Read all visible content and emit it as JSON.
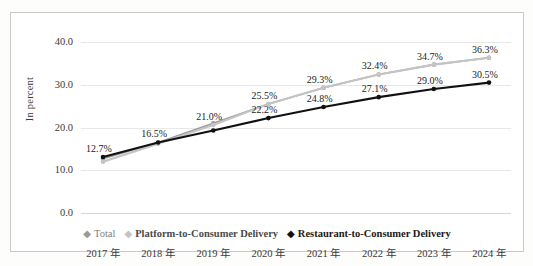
{
  "chart_data": {
    "type": "line",
    "title": "",
    "xlabel": "",
    "ylabel": "In percent",
    "categories": [
      "2017 年",
      "2018 年",
      "2019 年",
      "2020 年",
      "2021 年",
      "2022 年",
      "2023 年",
      "2024 年"
    ],
    "ylim": [
      0.0,
      40.0
    ],
    "yticks": [
      "0.0",
      "10.0",
      "20.0",
      "30.0",
      "40.0"
    ],
    "ytick_values": [
      0.0,
      10.0,
      20.0,
      30.0,
      40.0
    ],
    "grid": true,
    "legend_position": "bottom",
    "series": [
      {
        "name": "Total",
        "color": "#9a9a9a",
        "values": [
          12.7,
          16.5,
          21.0,
          25.5,
          29.3,
          32.4,
          34.7,
          36.3
        ],
        "labels": [
          "12.7%",
          "16.5%",
          "21.0%",
          "25.5%",
          "29.3%",
          "32.4%",
          "34.7%",
          "36.3%"
        ]
      },
      {
        "name": "Platform-to-Consumer Delivery",
        "color": "#c4c4c4",
        "values": [
          12.0,
          16.2,
          20.6,
          25.5,
          29.3,
          32.4,
          34.7,
          36.3
        ],
        "labels": [
          "",
          "",
          "21.0%",
          "25.5%",
          "29.3%",
          "32.4%",
          "34.7%",
          "36.3%"
        ]
      },
      {
        "name": "Restaurant-to-Consumer Delivery",
        "color": "#111111",
        "values": [
          13.1,
          16.5,
          19.3,
          22.2,
          24.8,
          27.1,
          29.0,
          30.5
        ],
        "labels": [
          "12.7%",
          "16.5%",
          "",
          "22.2%",
          "24.8%",
          "27.1%",
          "29.0%",
          "30.5%"
        ]
      }
    ],
    "point_labels": [
      {
        "text": "12.7%",
        "x": 0,
        "value": 13.1,
        "series": "Restaurant-to-Consumer Delivery"
      },
      {
        "text": "16.5%",
        "x": 1,
        "value": 16.5,
        "series": "Restaurant-to-Consumer Delivery"
      },
      {
        "text": "21.0%",
        "x": 2,
        "value": 20.6,
        "series": "Platform-to-Consumer Delivery"
      },
      {
        "text": "22.2%",
        "x": 3,
        "value": 22.2,
        "series": "Restaurant-to-Consumer Delivery"
      },
      {
        "text": "25.5%",
        "x": 3,
        "value": 25.5,
        "series": "Platform-to-Consumer Delivery"
      },
      {
        "text": "24.8%",
        "x": 4,
        "value": 24.8,
        "series": "Restaurant-to-Consumer Delivery"
      },
      {
        "text": "29.3%",
        "x": 4,
        "value": 29.3,
        "series": "Platform-to-Consumer Delivery"
      },
      {
        "text": "27.1%",
        "x": 5,
        "value": 27.1,
        "series": "Restaurant-to-Consumer Delivery"
      },
      {
        "text": "32.4%",
        "x": 5,
        "value": 32.4,
        "series": "Platform-to-Consumer Delivery"
      },
      {
        "text": "29.0%",
        "x": 6,
        "value": 29.0,
        "series": "Restaurant-to-Consumer Delivery"
      },
      {
        "text": "34.7%",
        "x": 6,
        "value": 34.7,
        "series": "Platform-to-Consumer Delivery"
      },
      {
        "text": "30.5%",
        "x": 7,
        "value": 30.5,
        "series": "Restaurant-to-Consumer Delivery"
      },
      {
        "text": "36.3%",
        "x": 7,
        "value": 36.3,
        "series": "Platform-to-Consumer Delivery"
      }
    ]
  },
  "legend": {
    "items": [
      {
        "label": "Total",
        "marker": "diamond-marker",
        "color": "#9a9a9a"
      },
      {
        "label": "Platform-to-Consumer Delivery",
        "marker": "diamond-marker",
        "color": "#c4c4c4"
      },
      {
        "label": "Restaurant-to-Consumer Delivery",
        "marker": "diamond-marker",
        "color": "#111111"
      }
    ]
  }
}
